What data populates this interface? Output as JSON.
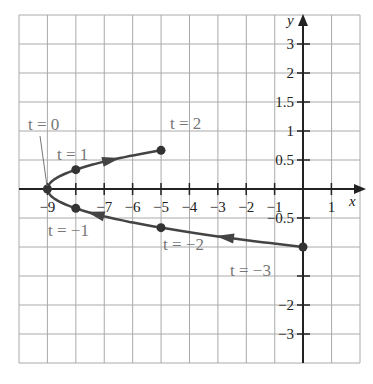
{
  "chart_data": {
    "type": "line",
    "title": "",
    "xlabel": "x",
    "ylabel": "y",
    "parametric": {
      "x": "t^2 - 9",
      "y": "t/3",
      "t_range": [
        -3,
        2
      ]
    },
    "points": [
      {
        "label": "t = −3",
        "t": -3,
        "x": 0,
        "y": -1
      },
      {
        "label": "t = −2",
        "t": -2,
        "x": -5,
        "y": -0.667
      },
      {
        "label": "t = −1",
        "t": -1,
        "x": -8,
        "y": -0.333
      },
      {
        "label": "t = 0",
        "t": 0,
        "x": -9,
        "y": 0
      },
      {
        "label": "t = 1",
        "t": 1,
        "x": -8,
        "y": 0.333
      },
      {
        "label": "t = 2",
        "t": 2,
        "x": -5,
        "y": 0.667
      }
    ],
    "x_ticks": [
      "−9",
      "−7",
      "−6",
      "−5",
      "−4",
      "−3",
      "−2",
      "−1",
      "1"
    ],
    "y_ticks": [
      "3",
      "2",
      "1.5",
      "1",
      "0.5",
      "−0.5",
      "−2",
      "−3"
    ],
    "xlim": [
      -10,
      2
    ],
    "grid": true,
    "arrows": "direction of increasing t",
    "legend": null
  },
  "labels": {
    "x_axis": "x",
    "y_axis": "y"
  }
}
